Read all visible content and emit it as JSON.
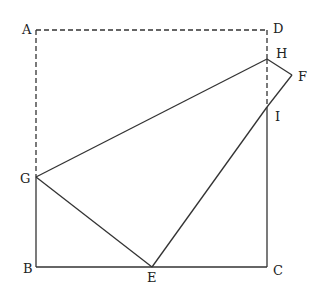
{
  "diagram": {
    "type": "geometry-folding-square",
    "points": {
      "A": {
        "label": "A",
        "x": 36,
        "y": 30
      },
      "D": {
        "label": "D",
        "x": 267,
        "y": 30
      },
      "H": {
        "label": "H",
        "x": 267,
        "y": 59
      },
      "F": {
        "label": "F",
        "x": 292,
        "y": 75
      },
      "I": {
        "label": "I",
        "x": 267,
        "y": 107
      },
      "G": {
        "label": "G",
        "x": 36,
        "y": 177
      },
      "B": {
        "label": "B",
        "x": 36,
        "y": 267
      },
      "E": {
        "label": "E",
        "x": 152,
        "y": 267
      },
      "C": {
        "label": "C",
        "x": 267,
        "y": 267
      }
    },
    "solid_segments": [
      "GB",
      "BE",
      "EC",
      "CI",
      "GE",
      "GH",
      "HF",
      "FI",
      "IE"
    ],
    "dashed_segments": [
      "AD",
      "AG",
      "DH",
      "HI"
    ],
    "colors": {
      "line": "#333333",
      "background": "#ffffff"
    }
  }
}
